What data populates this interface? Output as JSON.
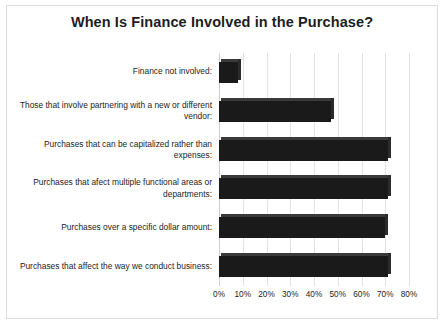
{
  "chart_data": {
    "type": "bar",
    "orientation": "horizontal",
    "title": "When Is Finance Involved in the Purchase?",
    "xlabel": "",
    "ylabel": "",
    "xlim": [
      0,
      80
    ],
    "grid": true,
    "legend": false,
    "xtick_labels": [
      "0%",
      "10%",
      "20%",
      "30%",
      "40%",
      "50%",
      "60%",
      "70%",
      "80%"
    ],
    "xtick_values": [
      0,
      10,
      20,
      30,
      40,
      50,
      60,
      70,
      80
    ],
    "categories": [
      "Finance not involved:",
      "Those that involve partnering with a new or different vendor:",
      "Purchases that can be capitalized rather than expenses:",
      "Purchases that afect multiple functional areas or departments:",
      "Purchases over a specific dollar amount:",
      "Purchases that affect the way we conduct business:"
    ],
    "values": [
      8,
      47,
      71,
      71,
      70,
      71
    ],
    "bar_color": "#1a1a1a"
  },
  "ticks": [
    {
      "label": "0%",
      "value": 0
    },
    {
      "label": "10%",
      "value": 10
    },
    {
      "label": "20%",
      "value": 20
    },
    {
      "label": "30%",
      "value": 30
    },
    {
      "label": "40%",
      "value": 40
    },
    {
      "label": "50%",
      "value": 50
    },
    {
      "label": "60%",
      "value": 60
    },
    {
      "label": "70%",
      "value": 70
    },
    {
      "label": "80%",
      "value": 80
    }
  ]
}
